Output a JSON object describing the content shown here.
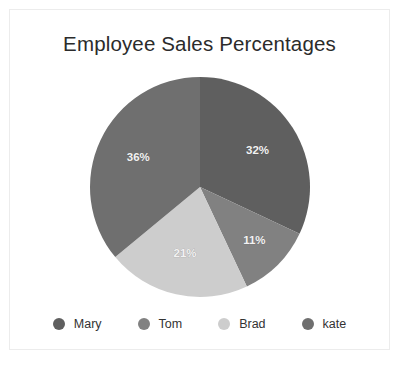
{
  "card": {
    "border_color": "#ececec",
    "background": "#ffffff"
  },
  "chart_data": {
    "type": "pie",
    "title": "Employee Sales Percentages",
    "xlabel": "",
    "ylabel": "",
    "legend_position": "bottom",
    "grid": false,
    "start_angle_deg": 0,
    "direction": "clockwise",
    "categories": [
      "Mary",
      "Tom",
      "Brad",
      "kate"
    ],
    "values": [
      32,
      11,
      21,
      36
    ],
    "data_labels": [
      "32%",
      "11%",
      "21%",
      "36%"
    ],
    "colors": [
      "#5f5f5f",
      "#818181",
      "#cdcdcd",
      "#6f6f6f"
    ],
    "slices": [
      {
        "label": "Mary",
        "value": 32,
        "data_label": "32%",
        "color": "#5f5f5f"
      },
      {
        "label": "Tom",
        "value": 11,
        "data_label": "11%",
        "color": "#818181"
      },
      {
        "label": "Brad",
        "value": 21,
        "data_label": "21%",
        "color": "#cdcdcd"
      },
      {
        "label": "kate",
        "value": 36,
        "data_label": "36%",
        "color": "#6f6f6f"
      }
    ]
  },
  "legend": {
    "items": [
      {
        "label": "Mary",
        "color": "#5f5f5f"
      },
      {
        "label": "Tom",
        "color": "#818181"
      },
      {
        "label": "Brad",
        "color": "#cdcdcd"
      },
      {
        "label": "kate",
        "color": "#6f6f6f"
      }
    ]
  }
}
